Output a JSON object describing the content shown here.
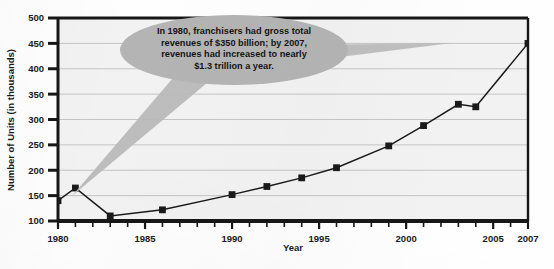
{
  "figure": {
    "background_color": "#fefefe",
    "plot_background_color": "#f2f2f2",
    "frame_color": "#171717",
    "gridline_color": "#b9b9b9",
    "series_color": "#1a1a1a",
    "callout_fill": "#b4b4b4",
    "callout_text_color": "#141414"
  },
  "callout": {
    "name": "annotation-callout",
    "lines": [
      "In 1980, franchisers had gross total",
      "revenues of $350 billion; by 2007,",
      "revenues had increased to nearly",
      "$1.3 trillion a year."
    ],
    "full_text": "In 1980, franchisers had gross total revenues of $350 billion; by 2007, revenues had increased to nearly $1.3 trillion a year."
  },
  "chart_data": {
    "type": "line",
    "title": "",
    "xlabel": "Year",
    "ylabel": "Number of Units (in thousands)",
    "xlim": [
      1980,
      2007
    ],
    "ylim": [
      100,
      500
    ],
    "ytick_step": 50,
    "yticks": [
      100,
      150,
      200,
      250,
      300,
      350,
      400,
      450,
      500
    ],
    "ytick_labels": [
      "100",
      "150",
      "200",
      "250",
      "300",
      "350",
      "400",
      "450",
      "500"
    ],
    "xticks": [
      1980,
      1985,
      1990,
      1995,
      2000,
      2005,
      2007
    ],
    "xtick_labels": [
      "1980",
      "1985",
      "1990",
      "1995",
      "2000",
      "2005",
      "2007"
    ],
    "xtick_minor_step": 1,
    "grid": true,
    "grid_axis": "y",
    "legend": false,
    "marker": "square",
    "series": [
      {
        "name": "Number of Units",
        "x": [
          1980,
          1981,
          1983,
          1986,
          1990,
          1992,
          1994,
          1996,
          1999,
          2001,
          2003,
          2004,
          2007
        ],
        "values": [
          140,
          165,
          110,
          122,
          152,
          168,
          185,
          205,
          248,
          288,
          330,
          325,
          450
        ]
      }
    ]
  }
}
